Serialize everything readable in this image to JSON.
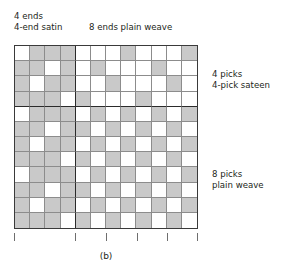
{
  "figure": {
    "caption": "(b)",
    "labels": {
      "top_left": "4 ends\n4-end satin",
      "top_right": "8 ends plain weave",
      "right_upper": "4 picks\n4-pick sateen",
      "right_lower": "8 picks\nplain weave"
    },
    "colors": {
      "filled_cell": "#c9c9c9",
      "empty_cell": "#ffffff",
      "minor_grid": "#8c8c8c",
      "major_grid": "#2b2b2b",
      "text": "#231f20",
      "tick": "#6e6e6e"
    }
  },
  "chart_data": {
    "type": "heatmap",
    "title": "(b)",
    "xlabel": "",
    "ylabel": "",
    "columns": 12,
    "rows": 12,
    "column_label": "ends",
    "row_label": "picks",
    "value_legend": {
      "1": "warp up (filled)",
      "0": "weft up (empty)"
    },
    "major_divider_after_column": 4,
    "major_divider_after_row": 4,
    "regions": [
      {
        "name": "4-end satin",
        "columns": [
          1,
          4
        ],
        "rows": [
          1,
          12
        ]
      },
      {
        "name": "4-pick sateen",
        "columns": [
          5,
          12
        ],
        "rows": [
          1,
          4
        ]
      },
      {
        "name": "plain weave",
        "columns": [
          5,
          12
        ],
        "rows": [
          5,
          12
        ]
      }
    ],
    "tick_positions": [
      0,
      4,
      6,
      8,
      10,
      12
    ],
    "matrix": [
      [
        0,
        1,
        1,
        1,
        0,
        0,
        0,
        1,
        0,
        0,
        0,
        1
      ],
      [
        1,
        1,
        0,
        1,
        0,
        1,
        0,
        0,
        0,
        1,
        0,
        0
      ],
      [
        1,
        0,
        1,
        1,
        0,
        0,
        1,
        0,
        0,
        0,
        1,
        0
      ],
      [
        1,
        1,
        1,
        0,
        1,
        0,
        0,
        0,
        1,
        0,
        0,
        0
      ],
      [
        0,
        1,
        1,
        1,
        0,
        1,
        0,
        1,
        0,
        1,
        0,
        1
      ],
      [
        1,
        1,
        0,
        1,
        1,
        0,
        1,
        0,
        1,
        0,
        1,
        0
      ],
      [
        1,
        0,
        1,
        1,
        0,
        1,
        0,
        1,
        0,
        1,
        0,
        1
      ],
      [
        1,
        1,
        1,
        0,
        1,
        0,
        1,
        0,
        1,
        0,
        1,
        0
      ],
      [
        0,
        1,
        1,
        1,
        0,
        1,
        0,
        1,
        0,
        1,
        0,
        1
      ],
      [
        1,
        1,
        0,
        1,
        1,
        0,
        1,
        0,
        1,
        0,
        1,
        0
      ],
      [
        1,
        0,
        1,
        1,
        0,
        1,
        0,
        1,
        0,
        1,
        0,
        1
      ],
      [
        1,
        1,
        1,
        0,
        1,
        0,
        1,
        0,
        1,
        0,
        1,
        0
      ]
    ]
  }
}
